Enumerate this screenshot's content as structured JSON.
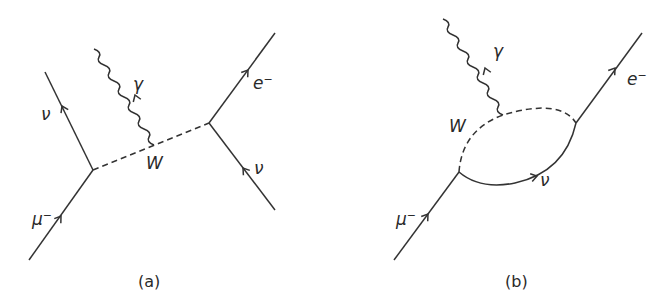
{
  "figure": {
    "panels": [
      {
        "caption": "(a)",
        "labels": {
          "nu_out": "ν",
          "muon_in": "μ",
          "muon_charge": "−",
          "photon": "γ",
          "w_boson": "W",
          "electron": "e",
          "electron_charge": "−",
          "nu_in": "ν"
        }
      },
      {
        "caption": "(b)",
        "labels": {
          "w_boson": "W",
          "photon": "γ",
          "electron": "e",
          "electron_charge": "−",
          "nu_loop": "ν",
          "muon_in": "μ",
          "muon_charge": "−"
        }
      }
    ],
    "line_color": "#333333"
  }
}
